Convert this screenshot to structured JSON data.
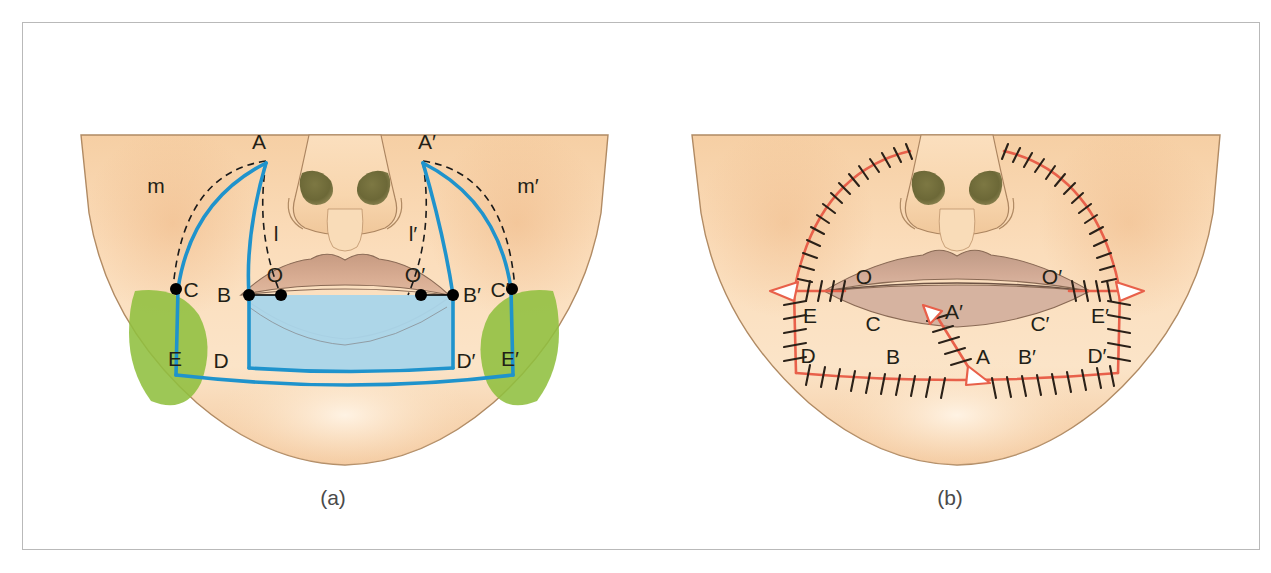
{
  "figure": {
    "domain_note": "surgical lip reconstruction diagram",
    "panels": [
      {
        "id": "a",
        "caption": "(a)",
        "title": "preoperative flap design markings"
      },
      {
        "id": "b",
        "caption": "(b)",
        "title": "postoperative suture lines"
      }
    ]
  },
  "colors": {
    "frame_border": "#b9b9b9",
    "page_background": "#ffffff",
    "skin_light": "#fbe3c6",
    "skin_mid": "#f7d0a2",
    "skin_shadow": "#eab989",
    "face_outline": "#b08a63",
    "upper_lip": "#c9a089",
    "lower_lip": "#cfa895",
    "lip_line": "#8a6a55",
    "nostril": "#6e6a3c",
    "nose_outline": "#ac8560",
    "flap_blue_line": "#1f93cc",
    "flap_blue_fill": "#a9d5ea",
    "excision_green": "#8fbf3f",
    "dashed_black": "#1a1a1a",
    "point_black": "#000000",
    "suture_red": "#e8604a",
    "suture_stitch": "#2b2118",
    "label_text": "#231f16",
    "caption_text": "#4a4a4a"
  },
  "panel_a": {
    "caption": "(a)",
    "points": [
      {
        "name": "A",
        "label": "A",
        "x": 243,
        "y": 138,
        "dot": false,
        "lx": 236,
        "ly": 126
      },
      {
        "name": "Ap",
        "label": "A′",
        "x": 400,
        "y": 138,
        "dot": false,
        "lx": 392,
        "ly": 126
      },
      {
        "name": "B",
        "label": "B",
        "x": 226,
        "y": 272,
        "dot": true,
        "lx": 199,
        "ly": 272
      },
      {
        "name": "Bp",
        "label": "B′",
        "x": 430,
        "y": 272,
        "dot": true,
        "lx": 442,
        "ly": 272
      },
      {
        "name": "C",
        "label": "C",
        "x": 153,
        "y": 266,
        "dot": true,
        "lx": 167,
        "ly": 271
      },
      {
        "name": "Cp",
        "label": "C′",
        "x": 489,
        "y": 266,
        "dot": true,
        "lx": 468,
        "ly": 271
      },
      {
        "name": "D",
        "label": "D",
        "x": 226,
        "y": 345,
        "dot": false,
        "lx": 196,
        "ly": 338
      },
      {
        "name": "Dp",
        "label": "D′",
        "x": 430,
        "y": 345,
        "dot": false,
        "lx": 436,
        "ly": 338
      },
      {
        "name": "E",
        "label": "E",
        "x": 153,
        "y": 348,
        "dot": false,
        "lx": 151,
        "ly": 336
      },
      {
        "name": "Ep",
        "label": "E′",
        "x": 489,
        "y": 348,
        "dot": false,
        "lx": 473,
        "ly": 336
      },
      {
        "name": "O",
        "label": "O",
        "x": 258,
        "y": 272,
        "dot": true,
        "lx": 249,
        "ly": 259
      },
      {
        "name": "Op",
        "label": "O′",
        "x": 398,
        "y": 272,
        "dot": true,
        "lx": 389,
        "ly": 259
      }
    ],
    "arc_labels": [
      {
        "name": "m",
        "label": "m",
        "x": 133,
        "y": 163
      },
      {
        "name": "mp",
        "label": "m′",
        "x": 500,
        "y": 163
      },
      {
        "name": "l",
        "label": "l",
        "x": 250,
        "y": 211
      },
      {
        "name": "lp",
        "label": "l′",
        "x": 390,
        "y": 211
      }
    ]
  },
  "panel_b": {
    "caption": "(b)",
    "points": [
      {
        "name": "O",
        "label": "O",
        "lx": 224,
        "ly": 255
      },
      {
        "name": "Op",
        "label": "O′",
        "lx": 402,
        "ly": 255
      },
      {
        "name": "E",
        "label": "E",
        "lx": 168,
        "ly": 294
      },
      {
        "name": "Ep",
        "label": "E′",
        "lx": 450,
        "ly": 294
      },
      {
        "name": "D",
        "label": "D",
        "lx": 166,
        "ly": 334
      },
      {
        "name": "Dp",
        "label": "D′",
        "lx": 448,
        "ly": 334
      },
      {
        "name": "C",
        "label": "C",
        "lx": 228,
        "ly": 303
      },
      {
        "name": "Cp",
        "label": "C′",
        "lx": 392,
        "ly": 303
      },
      {
        "name": "B",
        "label": "B",
        "lx": 250,
        "ly": 335
      },
      {
        "name": "Bp",
        "label": "B′",
        "lx": 380,
        "ly": 335
      },
      {
        "name": "A",
        "label": "A",
        "lx": 338,
        "ly": 334
      },
      {
        "name": "Ap",
        "label": "A′",
        "lx": 305,
        "ly": 291
      }
    ]
  }
}
